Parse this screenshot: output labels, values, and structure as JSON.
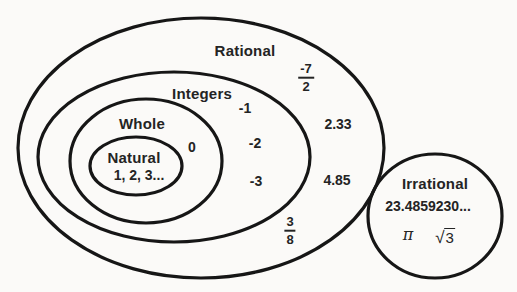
{
  "sets": {
    "rational": {
      "label": "Rational",
      "members": {
        "fraction_neg_seven_over_two": {
          "numerator": "-7",
          "denominator": "2"
        },
        "decimal_1": "2.33",
        "decimal_2": "4.85",
        "fraction_three_over_eight": {
          "numerator": "3",
          "denominator": "8"
        }
      }
    },
    "integers": {
      "label": "Integers",
      "members": [
        "-1",
        "-2",
        "-3"
      ]
    },
    "whole": {
      "label": "Whole",
      "members": [
        "0"
      ]
    },
    "natural": {
      "label": "Natural",
      "members": [
        "1, 2, 3..."
      ]
    },
    "irrational": {
      "label": "Irrational",
      "members": {
        "decimal": "23.4859230...",
        "pi": "π",
        "sqrt_sign": "√",
        "sqrt_radicand": "3"
      }
    }
  },
  "colors": {
    "stroke": "#161616",
    "text": "#242424",
    "background": "#fbfaf8"
  }
}
